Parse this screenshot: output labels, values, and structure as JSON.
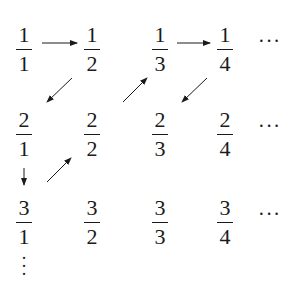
{
  "grid": {
    "rows": [
      [
        {
          "num": "1",
          "den": "1"
        },
        {
          "num": "1",
          "den": "2"
        },
        {
          "num": "1",
          "den": "3"
        },
        {
          "num": "1",
          "den": "4"
        }
      ],
      [
        {
          "num": "2",
          "den": "1"
        },
        {
          "num": "2",
          "den": "2"
        },
        {
          "num": "2",
          "den": "3"
        },
        {
          "num": "2",
          "den": "4"
        }
      ],
      [
        {
          "num": "3",
          "den": "1"
        },
        {
          "num": "3",
          "den": "2"
        },
        {
          "num": "3",
          "den": "3"
        },
        {
          "num": "3",
          "den": "4"
        }
      ]
    ],
    "row_ellipsis": "···",
    "column_ellipsis": "⋮"
  },
  "arrows": [
    {
      "from": "1/1",
      "to": "1/2",
      "direction": "right"
    },
    {
      "from": "1/2",
      "to": "2/1",
      "direction": "down-left"
    },
    {
      "from": "2/1",
      "to": "3/1",
      "direction": "down"
    },
    {
      "from": "3/1",
      "to": "2/2",
      "direction": "up-right"
    },
    {
      "from": "2/2",
      "to": "1/3",
      "direction": "up-right"
    },
    {
      "from": "1/3",
      "to": "1/4",
      "direction": "right"
    },
    {
      "from": "1/4",
      "to": "2/3",
      "direction": "down-left"
    }
  ],
  "colors": {
    "ink": "#1a1a1a",
    "background": "#ffffff"
  }
}
